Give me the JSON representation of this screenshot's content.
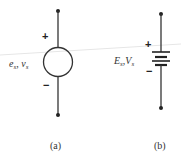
{
  "diagram": {
    "a": {
      "symbol": "independent-voltage-source-circle",
      "label_e": "e",
      "label_e_sub": "s",
      "label_sep": ", ",
      "label_v": "v",
      "label_v_sub": "s",
      "plus": "+",
      "minus": "−",
      "caption": "(a)"
    },
    "b": {
      "symbol": "dc-battery-source",
      "label_E": "E",
      "label_E_sub": "s",
      "label_sep": ",",
      "label_V": "V",
      "label_V_sub": "s",
      "plus": "+",
      "minus": "−",
      "caption": "(b)"
    },
    "colors": {
      "ink": "#333333",
      "background": "#ffffff"
    }
  }
}
